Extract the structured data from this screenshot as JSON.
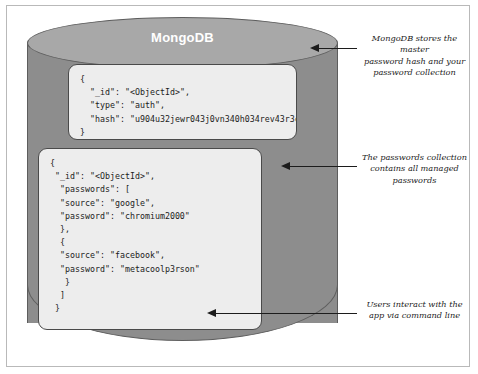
{
  "diagram": {
    "title": "MongoDB",
    "database": {
      "label": "MongoDB",
      "shape": "cylinder"
    },
    "documents": [
      {
        "name": "auth-document",
        "fields": {
          "_id": "<ObjectId>",
          "type": "auth",
          "hash": "u904u32jewr043j0vn340h034rev43r3ce"
        },
        "text": "{\n  \"_id\": \"<ObjectId>\",\n  \"type\": \"auth\",\n  \"hash\": \"u904u32jewr043j0vn340h034rev43r3ce\"\n}"
      },
      {
        "name": "passwords-document",
        "fields": {
          "_id": "<ObjectId>",
          "passwords": [
            {
              "source": "google",
              "password": "chromium2000"
            },
            {
              "source": "facebook",
              "password": "metacoolp3rson"
            }
          ]
        },
        "text": "{\n \"_id\": \"<ObjectId>\",\n  \"passwords\": [\n  \"source\": \"google\",\n  \"password\": \"chromium2000\"\n  },\n  {\n  \"source\": \"facebook\",\n  \"password\": \"metacoolp3rson\"\n   }\n  ]\n }"
      }
    ],
    "annotations": [
      {
        "name": "annotation-master-hash",
        "text": "MongoDB stores the master\npassword hash and your\npassword collection"
      },
      {
        "name": "annotation-passwords-collection",
        "text": "The passwords collection\ncontains all managed\npasswords"
      },
      {
        "name": "annotation-command-line",
        "text": "Users interact with the\napp via command line"
      }
    ],
    "colors": {
      "cylinder_body": "#8d8d8d",
      "cylinder_top": "#a8a8a8",
      "document_fill": "#ededed",
      "outline": "#4a4a4a",
      "title_text": "#ffffff"
    }
  }
}
